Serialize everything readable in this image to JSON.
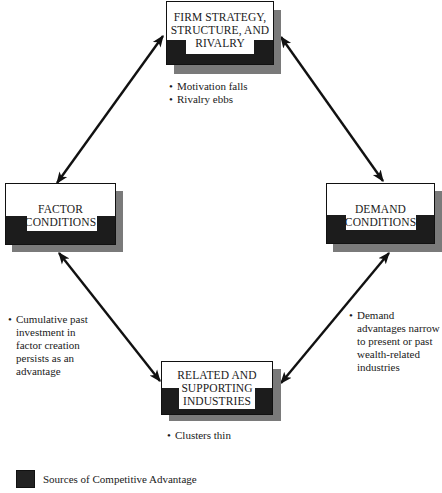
{
  "diagram": {
    "nodes": {
      "firm": {
        "label_lines": [
          "FIRM STRATEGY,",
          "STRUCTURE, AND",
          "RIVALRY"
        ],
        "notes": [
          "Motivation falls",
          "Rivalry ebbs"
        ]
      },
      "factor": {
        "label_lines": [
          "FACTOR",
          "CONDITIONS"
        ],
        "notes": [
          "Cumulative past investment in factor creation persists as an advantage"
        ]
      },
      "demand": {
        "label_lines": [
          "DEMAND",
          "CONDITIONS"
        ],
        "notes": [
          "Demand advantages narrow to present or past wealth-related industries"
        ]
      },
      "related": {
        "label_lines": [
          "RELATED AND",
          "SUPPORTING",
          "INDUSTRIES"
        ],
        "notes": [
          "Clusters thin"
        ]
      }
    },
    "edges": [
      {
        "from": "firm",
        "to": "factor",
        "type": "bidirectional-arrow"
      },
      {
        "from": "firm",
        "to": "demand",
        "type": "bidirectional-arrow"
      },
      {
        "from": "factor",
        "to": "related",
        "type": "bidirectional-arrow"
      },
      {
        "from": "demand",
        "to": "related",
        "type": "bidirectional-arrow"
      }
    ],
    "legend": {
      "swatch_color": "#222222",
      "label": "Sources of Competitive Advantage"
    },
    "colors": {
      "box_dark": "#1c1c1c",
      "shadow": "#7a7a7a",
      "arrow": "#111111"
    }
  }
}
